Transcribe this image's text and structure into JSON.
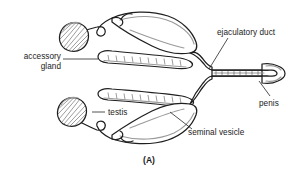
{
  "figure": {
    "caption": "(A)",
    "background_color": "#ffffff",
    "line_color": "#1f1f1f",
    "shade_color": "#9a9a9a",
    "text_color": "#1a1a1a"
  },
  "labels": {
    "accessory_gland_line1": "accessory",
    "accessory_gland_line2": "gland",
    "testis": "testis",
    "ejaculatory_duct": "ejaculatory duct",
    "penis": "penis",
    "seminal_vesicle": "seminal vesicle"
  },
  "structures": [
    {
      "name": "testis-upper",
      "label": "testis",
      "side": "upper-left"
    },
    {
      "name": "testis-lower",
      "label": "testis",
      "side": "lower-left"
    },
    {
      "name": "vas-deferens-upper",
      "label": "",
      "side": "upper-left"
    },
    {
      "name": "vas-deferens-lower",
      "label": "",
      "side": "lower-left"
    },
    {
      "name": "accessory-gland-upper",
      "label": "accessory gland",
      "side": "upper"
    },
    {
      "name": "accessory-gland-lower",
      "label": "accessory gland",
      "side": "lower"
    },
    {
      "name": "seminal-vesicle-upper",
      "label": "seminal vesicle",
      "side": "upper"
    },
    {
      "name": "seminal-vesicle-lower",
      "label": "seminal vesicle",
      "side": "lower"
    },
    {
      "name": "ejaculatory-duct",
      "label": "ejaculatory duct",
      "side": "right"
    },
    {
      "name": "penis",
      "label": "penis",
      "side": "far-right"
    }
  ]
}
